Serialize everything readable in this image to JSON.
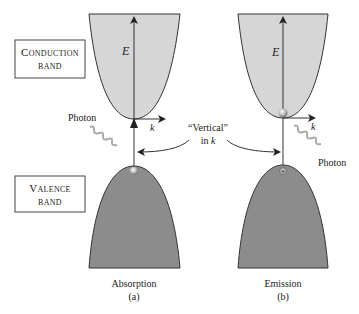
{
  "labels": {
    "conduction_box": [
      "Conduction",
      "band"
    ],
    "valence_box": [
      "Valence",
      "band"
    ],
    "energy_axis": "E",
    "momentum_axis": "k",
    "photon_left": "Photon",
    "photon_right": "Photon",
    "vertical_note_line1": "“Vertical”",
    "vertical_note_line2": "in k",
    "panel_a_title": "Absorption",
    "panel_a_letter": "(a)",
    "panel_b_title": "Emission",
    "panel_b_letter": "(b)"
  },
  "colors": {
    "conduction_fill": "#d6d6d6",
    "valence_fill": "#8c8c8c",
    "stroke": "#333333"
  },
  "panels": [
    {
      "id": "a",
      "process": "Absorption",
      "electron_position": "valence-top moving to conduction-bottom",
      "photon": "incoming"
    },
    {
      "id": "b",
      "process": "Emission",
      "electron_position": "conduction-bottom moving to valence-top",
      "photon": "outgoing"
    }
  ]
}
